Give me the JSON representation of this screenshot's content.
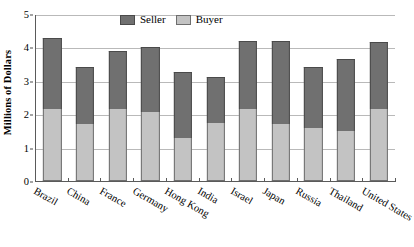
{
  "chart_data": {
    "type": "bar",
    "subtype": "stacked-bar",
    "title": "",
    "xlabel": "",
    "ylabel": "Millions of Dollars",
    "ylim": [
      0,
      5
    ],
    "yticks": [
      0,
      1,
      2,
      3,
      4,
      5
    ],
    "ytick_labels": [
      "0",
      "1",
      "2",
      "3",
      "4",
      "5"
    ],
    "grid": true,
    "legend_position": "top-center",
    "categories": [
      "Brazil",
      "China",
      "France",
      "Germany",
      "Hong Kong",
      "India",
      "Israel",
      "Japan",
      "Russia",
      "Thailand",
      "United States"
    ],
    "series": [
      {
        "name": "Buyer",
        "color": "#c3c3c3",
        "values": [
          2.15,
          1.7,
          2.15,
          2.08,
          1.3,
          1.75,
          2.15,
          1.7,
          1.6,
          1.5,
          2.15
        ]
      },
      {
        "name": "Seller",
        "color": "#707070",
        "values": [
          2.12,
          1.7,
          1.75,
          1.92,
          1.95,
          1.35,
          2.05,
          2.5,
          1.8,
          2.15,
          2.0
        ]
      }
    ],
    "totals": [
      4.27,
      3.4,
      3.9,
      4.0,
      3.25,
      3.1,
      4.2,
      4.2,
      3.4,
      3.65,
      4.15
    ]
  },
  "legend": {
    "entries": [
      {
        "label": "Seller",
        "color": "#707070"
      },
      {
        "label": "Buyer",
        "color": "#c3c3c3"
      }
    ]
  },
  "colors": {
    "seller": "#707070",
    "buyer": "#c3c3c3",
    "axis": "#5a5a5a",
    "gridline": "#b9b9b9",
    "background": "#ffffff"
  }
}
